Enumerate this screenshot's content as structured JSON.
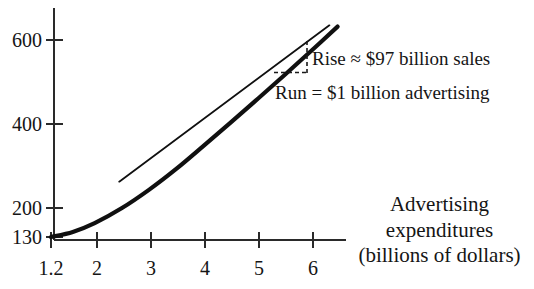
{
  "chart_data": {
    "type": "line",
    "title": "",
    "subtitle": "",
    "xlabel_lines": [
      "Advertising",
      "expenditures",
      "(billions of dollars)"
    ],
    "ylabel": "",
    "xlim": [
      1.2,
      6.45
    ],
    "ylim": [
      130,
      640
    ],
    "grid": false,
    "legend": null,
    "x_ticks": [
      {
        "value": 1.2,
        "label": "1.2",
        "px": 51
      },
      {
        "value": 2,
        "label": "2",
        "px": 97
      },
      {
        "value": 3,
        "label": "3",
        "px": 151
      },
      {
        "value": 4,
        "label": "4",
        "px": 205
      },
      {
        "value": 5,
        "label": "5",
        "px": 259
      },
      {
        "value": 6,
        "label": "6",
        "px": 313
      }
    ],
    "y_ticks": [
      {
        "value": 600,
        "label": "600",
        "px": 40
      },
      {
        "value": 400,
        "label": "400",
        "px": 124
      },
      {
        "value": 200,
        "label": "200",
        "px": 208
      },
      {
        "value": 130,
        "label": "130",
        "px": 237
      }
    ],
    "series": [
      {
        "name": "sales curve",
        "style": "solid-thick",
        "points": [
          {
            "x": 1.2,
            "y": 130
          },
          {
            "x": 1.6,
            "y": 142
          },
          {
            "x": 2.0,
            "y": 163
          },
          {
            "x": 2.5,
            "y": 199
          },
          {
            "x": 3.0,
            "y": 243
          },
          {
            "x": 3.5,
            "y": 293
          },
          {
            "x": 4.0,
            "y": 348
          },
          {
            "x": 4.5,
            "y": 404
          },
          {
            "x": 5.0,
            "y": 461
          },
          {
            "x": 5.5,
            "y": 519
          },
          {
            "x": 6.0,
            "y": 578
          },
          {
            "x": 6.45,
            "y": 632
          }
        ]
      },
      {
        "name": "tangent line",
        "style": "solid-thin",
        "points": [
          {
            "x": 2.45,
            "y": 262
          },
          {
            "x": 6.3,
            "y": 635
          }
        ]
      }
    ],
    "annotations": [
      {
        "name": "rise-label",
        "text": "Rise ≈ $97 billion sales",
        "x_px": 312,
        "y_px": 49
      },
      {
        "name": "run-label",
        "text": "Run = $1 billion advertising",
        "x_px": 275,
        "y_px": 83
      }
    ],
    "slope_triangle": {
      "rise_value": 97,
      "rise_units": "billion sales",
      "run_value": 1,
      "run_units": "billion advertising",
      "style": "dashed",
      "corner_px": {
        "x": 307,
        "y": 72
      },
      "vertical_top_px": 41,
      "horizontal_left_px": 274
    },
    "colors": {
      "ink": "#151515",
      "background": "#ffffff",
      "axis": "#2a2a2a"
    }
  }
}
